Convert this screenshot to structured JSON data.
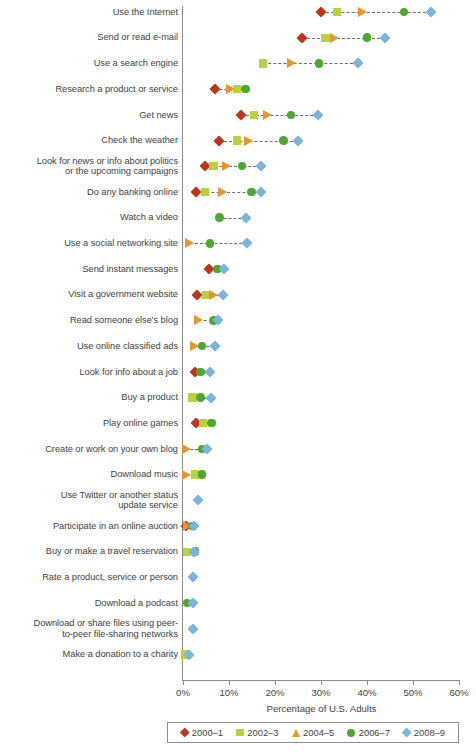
{
  "chart_data": {
    "type": "scatter",
    "title": "",
    "xlabel": "Percentage of U.S. Adults",
    "ylabel": "",
    "xlim": [
      0,
      60
    ],
    "xticks": [
      0,
      10,
      20,
      30,
      40,
      50,
      60
    ],
    "xtick_labels": [
      "0%",
      "10%",
      "20%",
      "30%",
      "40%",
      "50%",
      "60%"
    ],
    "grid": false,
    "legend_position": "bottom",
    "series": [
      {
        "name": "2000–1",
        "color": "#c0341a",
        "marker": "diamond"
      },
      {
        "name": "2002–3",
        "color": "#b9d13a",
        "marker": "square"
      },
      {
        "name": "2004–5",
        "color": "#e8962a",
        "marker": "triangle"
      },
      {
        "name": "2006–7",
        "color": "#4ea72e",
        "marker": "circle"
      },
      {
        "name": "2008–9",
        "color": "#7bb3e0",
        "marker": "diamond"
      }
    ],
    "categories": [
      "Use the Internet",
      "Send or read e-mail",
      "Use a search engine",
      "Research a product or service",
      "Get news",
      "Check the weather",
      "Look for news or info about politics or the upcoming campaigns",
      "Do any banking online",
      "Watch a video",
      "Use a social networking site",
      "Send instant messages",
      "Visit a government website",
      "Read someone else's blog",
      "Use online classified ads",
      "Look for info about a job",
      "Buy a product",
      "Play online games",
      "Create or work on your own blog",
      "Download music",
      "Use Twitter or another status update service",
      "Participate in an online auction",
      "Buy or make a travel reservation",
      "Rate a product, service or person",
      "Download a podcast",
      "Download or share files using peer-to-peer file-sharing networks",
      "Make a donation to a charity"
    ],
    "rows": [
      {
        "label_lines": [
          "Use the Internet"
        ],
        "values": {
          "2000-1": 30.0,
          "2002-3": 33.5,
          "2004-5": 39.0,
          "2006-7": 48.0,
          "2008-9": 54.0
        }
      },
      {
        "label_lines": [
          "Send or read e-mail"
        ],
        "values": {
          "2000-1": 25.9,
          "2002-3": 31.0,
          "2004-5": 33.0,
          "2006-7": 40.0,
          "2008-9": 44.0
        }
      },
      {
        "label_lines": [
          "Use a search engine"
        ],
        "values": {
          "2002-3": 17.4,
          "2004-5": 23.5,
          "2006-7": 29.6,
          "2008-9": 38.0
        }
      },
      {
        "label_lines": [
          "Research a product or service"
        ],
        "values": {
          "2000-1": 7.0,
          "2004-5": 10.4,
          "2002-3": 11.8,
          "2006-7": 13.6
        }
      },
      {
        "label_lines": [
          "Get news"
        ],
        "values": {
          "2000-1": 12.5,
          "2002-3": 15.4,
          "2004-5": 18.3,
          "2006-7": 23.5,
          "2008-9": 29.3
        }
      },
      {
        "label_lines": [
          "Check the weather"
        ],
        "values": {
          "2000-1": 7.9,
          "2002-3": 11.7,
          "2004-5": 14.2,
          "2006-7": 21.8,
          "2008-9": 25.0
        }
      },
      {
        "label_lines": [
          "Look for news or info about politics",
          "or the upcoming campaigns"
        ],
        "values": {
          "2000-1": 4.8,
          "2002-3": 6.6,
          "2004-5": 9.5,
          "2006-7": 12.8,
          "2008-9": 16.9
        }
      },
      {
        "label_lines": [
          "Do any banking online"
        ],
        "values": {
          "2000-1": 2.8,
          "2002-3": 4.8,
          "2004-5": 8.6,
          "2006-7": 14.9,
          "2008-9": 17.0
        }
      },
      {
        "label_lines": [
          "Watch a video"
        ],
        "values": {
          "2006-7": 7.9,
          "2008-9": 13.8
        }
      },
      {
        "label_lines": [
          "Use a social networking site"
        ],
        "values": {
          "2004-5": 1.5,
          "2006-7": 5.9,
          "2008-9": 14.0
        }
      },
      {
        "label_lines": [
          "Send instant messages"
        ],
        "values": {
          "2000-1": 5.7,
          "2006-7": 7.5,
          "2008-9": 9.0
        }
      },
      {
        "label_lines": [
          "Visit a government website"
        ],
        "values": {
          "2000-1": 3.0,
          "2002-3": 5.0,
          "2004-5": 6.6,
          "2008-9": 8.6
        }
      },
      {
        "label_lines": [
          "Read someone else's blog"
        ],
        "values": {
          "2004-5": 3.3,
          "2006-7": 6.6,
          "2008-9": 7.7
        }
      },
      {
        "label_lines": [
          "Use online classified ads"
        ],
        "values": {
          "2004-5": 2.6,
          "2006-7": 4.1,
          "2008-9": 7.0
        }
      },
      {
        "label_lines": [
          "Look for info about a job"
        ],
        "values": {
          "2000-1": 2.6,
          "2006-7": 3.8,
          "2008-9": 5.9
        }
      },
      {
        "label_lines": [
          "Buy a product"
        ],
        "values": {
          "2002-3": 2.1,
          "2006-7": 3.8,
          "2008-9": 6.0
        }
      },
      {
        "label_lines": [
          "Play online games"
        ],
        "values": {
          "2000-1": 2.8,
          "2002-3": 4.3,
          "2006-7": 6.2
        }
      },
      {
        "label_lines": [
          "Create or work on your own blog"
        ],
        "values": {
          "2004-5": 0.7,
          "2006-7": 4.1,
          "2008-9": 5.2
        }
      },
      {
        "label_lines": [
          "Download music"
        ],
        "values": {
          "2004-5": 0.8,
          "2002-3": 2.6,
          "2006-7": 4.1
        }
      },
      {
        "label_lines": [
          "Use Twitter or another status",
          "update service"
        ],
        "values": {
          "2008-9": 3.3
        }
      },
      {
        "label_lines": [
          "Participate in an online auction"
        ],
        "values": {
          "2000-1": 0.7,
          "2004-5": 1.0,
          "2006-7": 2.0,
          "2008-9": 2.3
        }
      },
      {
        "label_lines": [
          "Buy or make a travel reservation"
        ],
        "values": {
          "2002-3": 0.9,
          "2006-7": 2.6,
          "2008-9": 2.3
        }
      },
      {
        "label_lines": [
          "Rate a product, service or person"
        ],
        "values": {
          "2008-9": 2.1
        }
      },
      {
        "label_lines": [
          "Download a podcast"
        ],
        "values": {
          "2006-7": 0.9,
          "2008-9": 2.2
        }
      },
      {
        "label_lines": [
          "Download or share files using peer-",
          "to-peer file-sharing networks"
        ],
        "values": {
          "2008-9": 2.2
        }
      },
      {
        "label_lines": [
          "Make a donation to a charity"
        ],
        "values": {
          "2002-3": 0.4,
          "2008-9": 1.4
        }
      }
    ]
  }
}
